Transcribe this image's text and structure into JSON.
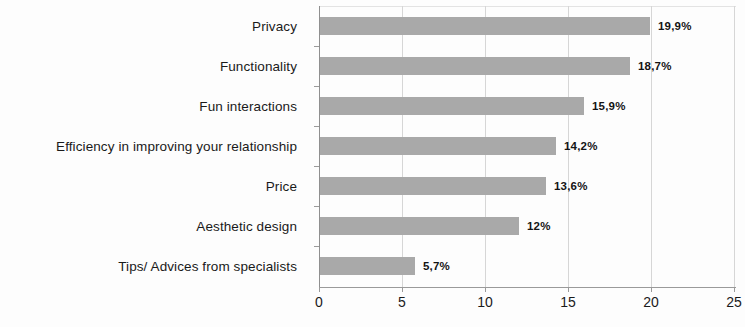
{
  "chart_data": {
    "type": "bar",
    "orientation": "horizontal",
    "title": "",
    "subtitle": "",
    "xlabel": "",
    "ylabel": "",
    "xlim": [
      0,
      25
    ],
    "x_ticks": [
      "0",
      "5",
      "10",
      "15",
      "20",
      "25"
    ],
    "x_tick_values": [
      0,
      5,
      10,
      15,
      20,
      25
    ],
    "grid": "vertical",
    "legend": "none",
    "bar_color": "#a9a9a9",
    "categories": [
      "Privacy",
      "Functionality",
      "Fun interactions",
      "Efficiency in improving your relationship",
      "Price",
      "Aesthetic design",
      "Tips/ Advices from specialists"
    ],
    "values": [
      19.9,
      18.7,
      15.9,
      14.2,
      13.6,
      12,
      5.7
    ],
    "data_labels": [
      "19,9%",
      "18,7%",
      "15,9%",
      "14,2%",
      "13,6%",
      "12%",
      "5,7%"
    ]
  }
}
